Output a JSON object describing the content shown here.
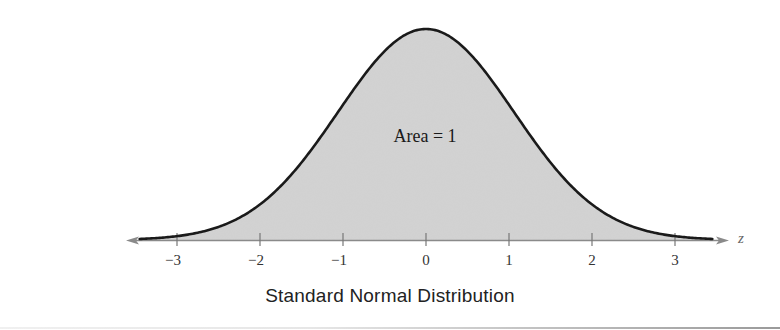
{
  "chart_data": {
    "type": "area",
    "title": "Standard Normal Distribution",
    "xlabel": "z",
    "ylabel": "",
    "annotation": "Area = 1",
    "x_ticks": [
      -3,
      -2,
      -1,
      0,
      1,
      2,
      3
    ],
    "x_tick_labels": [
      "−3",
      "−2",
      "−1",
      "0",
      "1",
      "2",
      "3"
    ],
    "xlim": [
      -3.5,
      3.5
    ],
    "grid": false,
    "legend": null,
    "series": [
      {
        "name": "standard normal pdf",
        "mean": 0,
        "sd": 1,
        "x": [
          -3.5,
          -3,
          -2.5,
          -2,
          -1.5,
          -1,
          -0.5,
          0,
          0.5,
          1,
          1.5,
          2,
          2.5,
          3,
          3.5
        ],
        "y": [
          0.0009,
          0.0044,
          0.0175,
          0.054,
          0.1295,
          0.242,
          0.3521,
          0.3989,
          0.3521,
          0.242,
          0.1295,
          0.054,
          0.0175,
          0.0044,
          0.0009
        ]
      }
    ],
    "colors": {
      "fill": "#d3d3d3",
      "curve": "#1a1a1a",
      "axis": "#8a8a8a"
    }
  },
  "labels": {
    "title": "Standard Normal Distribution",
    "area": "Area = 1",
    "axis_var": "z",
    "ticks": [
      "−3",
      "−2",
      "−1",
      "0",
      "1",
      "2",
      "3"
    ]
  }
}
